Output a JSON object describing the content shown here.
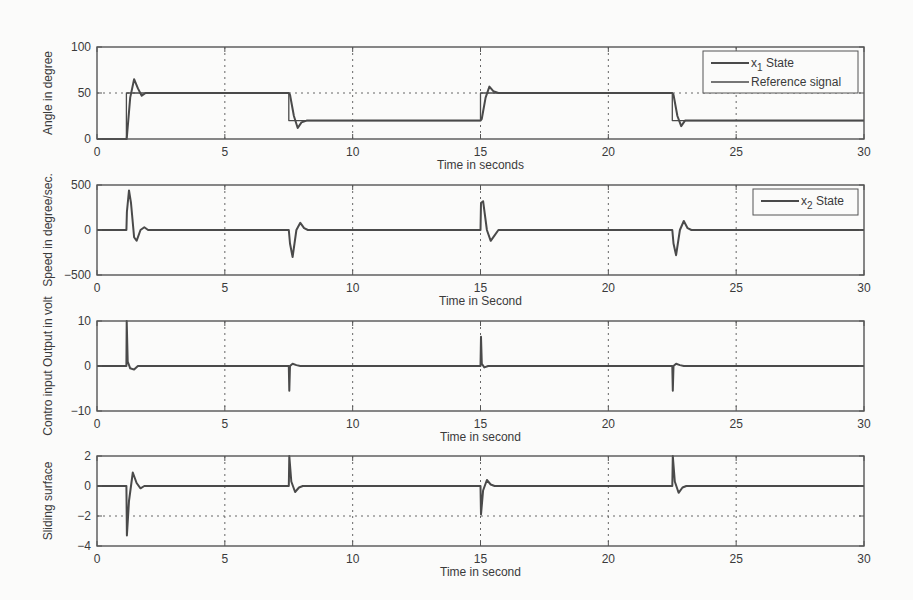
{
  "chart_data": [
    {
      "type": "line",
      "title": "",
      "xlabel": "Time in seconds",
      "ylabel": "Angle in degree",
      "xlim": [
        0,
        30
      ],
      "ylim": [
        0,
        100
      ],
      "xticks": [
        0,
        5,
        10,
        15,
        20,
        25,
        30
      ],
      "yticks": [
        0,
        50,
        100
      ],
      "grid": true,
      "legend_position": "upper right",
      "series": [
        {
          "name": "x1 State",
          "x": [
            0,
            1.15,
            1.16,
            1.3,
            1.45,
            1.6,
            1.75,
            1.9,
            7.5,
            7.55,
            7.7,
            7.85,
            8.0,
            8.2,
            15.0,
            15.05,
            15.2,
            15.35,
            15.5,
            15.7,
            22.5,
            22.55,
            22.7,
            22.85,
            23.0,
            23.2,
            30
          ],
          "y": [
            0,
            0,
            0,
            45,
            65,
            55,
            47,
            50,
            50,
            48,
            25,
            12,
            18,
            20,
            20,
            22,
            45,
            57,
            52,
            50,
            50,
            48,
            25,
            14,
            20,
            20,
            20
          ]
        },
        {
          "name": "Reference signal",
          "x": [
            0,
            1.15,
            1.15,
            7.5,
            7.5,
            15.0,
            15.0,
            22.5,
            22.5,
            30
          ],
          "y": [
            0,
            0,
            50,
            50,
            20,
            20,
            50,
            50,
            20,
            20
          ]
        }
      ],
      "reference_lines": [
        {
          "axis": "y",
          "value": 50,
          "style": "dotted"
        }
      ],
      "legend_entries": [
        {
          "label_main": "x",
          "label_sub": "1",
          "label_rest": " State"
        },
        {
          "label_main": "Reference signal",
          "label_sub": "",
          "label_rest": ""
        }
      ]
    },
    {
      "type": "line",
      "title": "",
      "xlabel": "Time in Second",
      "ylabel": "Speed in degree/sec.",
      "xlim": [
        0,
        30
      ],
      "ylim": [
        -500,
        500
      ],
      "xticks": [
        0,
        5,
        10,
        15,
        20,
        25,
        30
      ],
      "yticks": [
        -500,
        0,
        500
      ],
      "grid": true,
      "legend_position": "upper right",
      "series": [
        {
          "name": "x2 State",
          "x": [
            0,
            1.15,
            1.17,
            1.25,
            1.33,
            1.45,
            1.55,
            1.7,
            1.85,
            2.0,
            7.5,
            7.55,
            7.65,
            7.8,
            7.95,
            8.1,
            8.25,
            15.0,
            15.02,
            15.1,
            15.25,
            15.4,
            15.55,
            15.7,
            22.5,
            22.55,
            22.65,
            22.8,
            22.95,
            23.1,
            23.25,
            30
          ],
          "y": [
            0,
            0,
            200,
            440,
            300,
            -80,
            -120,
            0,
            30,
            0,
            0,
            -150,
            -300,
            0,
            80,
            20,
            0,
            0,
            300,
            320,
            0,
            -120,
            -60,
            0,
            0,
            -150,
            -280,
            0,
            100,
            20,
            0,
            0
          ]
        }
      ],
      "legend_entries": [
        {
          "label_main": "x",
          "label_sub": "2",
          "label_rest": " State"
        }
      ]
    },
    {
      "type": "line",
      "title": "",
      "xlabel": "Time in second",
      "ylabel": "Contro input Output in volt",
      "xlim": [
        0,
        30
      ],
      "ylim": [
        -10,
        10
      ],
      "xticks": [
        0,
        5,
        10,
        15,
        20,
        25,
        30
      ],
      "yticks": [
        -10,
        0,
        10
      ],
      "grid": true,
      "series": [
        {
          "name": "Control input",
          "x": [
            0,
            1.15,
            1.16,
            1.2,
            1.3,
            1.45,
            1.6,
            1.8,
            7.5,
            7.52,
            7.55,
            7.65,
            7.8,
            7.95,
            15.0,
            15.02,
            15.05,
            15.15,
            15.3,
            15.5,
            22.5,
            22.52,
            22.55,
            22.65,
            22.8,
            22.95,
            30
          ],
          "y": [
            0,
            0,
            10,
            1,
            -0.5,
            -0.8,
            0,
            0,
            0,
            -5.5,
            0,
            0.5,
            0.2,
            0,
            0,
            6.5,
            0.5,
            -0.3,
            0,
            0,
            0,
            -5.5,
            0,
            0.5,
            0.2,
            0,
            0
          ]
        }
      ]
    },
    {
      "type": "line",
      "title": "",
      "xlabel": "Time in second",
      "ylabel": "Sliding surface",
      "xlim": [
        0,
        30
      ],
      "ylim": [
        -4,
        2
      ],
      "xticks": [
        0,
        5,
        10,
        15,
        20,
        25,
        30
      ],
      "yticks": [
        -4,
        -2,
        0,
        2
      ],
      "grid": true,
      "series": [
        {
          "name": "Sliding surface",
          "x": [
            0,
            1.15,
            1.17,
            1.25,
            1.4,
            1.55,
            1.7,
            1.85,
            7.5,
            7.52,
            7.6,
            7.75,
            7.9,
            8.05,
            15.0,
            15.02,
            15.1,
            15.25,
            15.4,
            15.55,
            22.5,
            22.52,
            22.6,
            22.75,
            22.9,
            23.05,
            30
          ],
          "y": [
            0,
            0,
            -3.3,
            -1,
            0.9,
            0.2,
            -0.15,
            0,
            0,
            2.0,
            0.3,
            -0.4,
            -0.1,
            0,
            0,
            -1.9,
            -0.3,
            0.4,
            0.1,
            0,
            0,
            2.0,
            0.3,
            -0.45,
            -0.1,
            0,
            0
          ]
        }
      ],
      "reference_lines": [
        {
          "axis": "y",
          "value": -2,
          "style": "dotted"
        }
      ]
    }
  ],
  "colors": {
    "line": "#4a4a4a",
    "axes": "#555555",
    "grid": "#666666",
    "text": "#3a3a3a",
    "background": "#fbfbfa"
  }
}
